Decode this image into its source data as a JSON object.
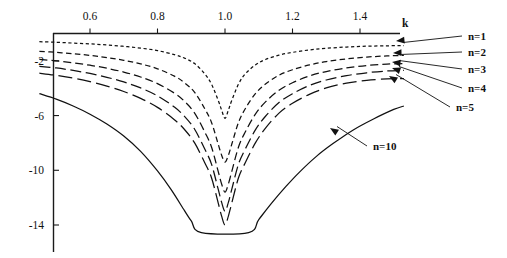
{
  "chart_data": {
    "type": "line",
    "title": "",
    "subtitle": "",
    "xlabel": "k",
    "ylabel": "",
    "xlim": [
      0.45,
      1.56
    ],
    "ylim": [
      -15.2,
      0.0
    ],
    "grid": false,
    "legend_position": "right-annotations",
    "x_ticks": [
      0.6,
      0.8,
      1.0,
      1.2,
      1.4
    ],
    "x_tick_labels": [
      "0.6",
      "0.8",
      "1.0",
      "1.2",
      "1.4"
    ],
    "y_ticks": [
      -2,
      -6,
      -10,
      -14
    ],
    "y_tick_labels": [
      "-2",
      "-6",
      "-10",
      "-14"
    ],
    "axis_note": "x-axis drawn at top of plot, y-axis at left; curves dip to sharp minima at k = 1.0",
    "series": [
      {
        "name": "n=1",
        "label": "n=1",
        "style": "dotted",
        "minimum_x": 1.0,
        "minimum_y": -6.2,
        "left_end_y": -0.6,
        "right_end_y": -0.9,
        "x": [
          0.45,
          0.5,
          0.55,
          0.6,
          0.65,
          0.7,
          0.75,
          0.8,
          0.85,
          0.88,
          0.91,
          0.94,
          0.96,
          0.98,
          0.99,
          1.0,
          1.01,
          1.02,
          1.04,
          1.06,
          1.09,
          1.12,
          1.16,
          1.2,
          1.25,
          1.3,
          1.36,
          1.42,
          1.48,
          1.53
        ],
        "y": [
          -0.6,
          -0.64,
          -0.7,
          -0.76,
          -0.84,
          -0.94,
          -1.07,
          -1.25,
          -1.55,
          -1.8,
          -2.2,
          -2.95,
          -3.7,
          -4.9,
          -5.6,
          -6.2,
          -5.6,
          -4.9,
          -3.7,
          -2.95,
          -2.3,
          -1.9,
          -1.58,
          -1.38,
          -1.2,
          -1.08,
          -0.99,
          -0.93,
          -0.9,
          -0.88
        ]
      },
      {
        "name": "n=2",
        "label": "n=2",
        "style": "dashed-short",
        "minimum_x": 1.0,
        "minimum_y": -9.4,
        "left_end_y": -1.3,
        "right_end_y": -1.6,
        "x": [
          0.45,
          0.5,
          0.55,
          0.6,
          0.65,
          0.7,
          0.75,
          0.8,
          0.85,
          0.88,
          0.91,
          0.94,
          0.96,
          0.98,
          0.99,
          1.0,
          1.01,
          1.02,
          1.04,
          1.06,
          1.09,
          1.12,
          1.16,
          1.2,
          1.25,
          1.3,
          1.36,
          1.42,
          1.48,
          1.53
        ],
        "y": [
          -1.3,
          -1.38,
          -1.48,
          -1.6,
          -1.76,
          -1.96,
          -2.22,
          -2.58,
          -3.12,
          -3.6,
          -4.3,
          -5.5,
          -6.5,
          -8.1,
          -8.9,
          -9.4,
          -8.9,
          -8.1,
          -6.5,
          -5.5,
          -4.4,
          -3.7,
          -3.05,
          -2.65,
          -2.3,
          -2.05,
          -1.86,
          -1.72,
          -1.64,
          -1.6
        ]
      },
      {
        "name": "n=3",
        "label": "n=3",
        "style": "dashed-medium",
        "minimum_x": 1.0,
        "minimum_y": -11.6,
        "left_end_y": -1.9,
        "right_end_y": -2.2,
        "x": [
          0.45,
          0.5,
          0.55,
          0.6,
          0.65,
          0.7,
          0.75,
          0.8,
          0.85,
          0.88,
          0.91,
          0.94,
          0.96,
          0.98,
          0.99,
          1.0,
          1.01,
          1.02,
          1.04,
          1.06,
          1.09,
          1.12,
          1.16,
          1.2,
          1.25,
          1.3,
          1.36,
          1.42,
          1.48,
          1.53
        ],
        "y": [
          -1.9,
          -2.0,
          -2.14,
          -2.32,
          -2.54,
          -2.82,
          -3.18,
          -3.66,
          -4.36,
          -4.96,
          -5.82,
          -7.2,
          -8.3,
          -10.1,
          -11.0,
          -11.6,
          -11.0,
          -10.1,
          -8.3,
          -7.2,
          -5.9,
          -5.0,
          -4.15,
          -3.6,
          -3.1,
          -2.78,
          -2.52,
          -2.34,
          -2.24,
          -2.2
        ]
      },
      {
        "name": "n=4",
        "label": "n=4",
        "style": "dashed-long",
        "minimum_x": 1.0,
        "minimum_y": -13.0,
        "left_end_y": -2.4,
        "right_end_y": -2.7,
        "x": [
          0.45,
          0.5,
          0.55,
          0.6,
          0.65,
          0.7,
          0.75,
          0.8,
          0.85,
          0.88,
          0.91,
          0.94,
          0.96,
          0.98,
          0.99,
          1.0,
          1.01,
          1.02,
          1.04,
          1.06,
          1.09,
          1.12,
          1.16,
          1.2,
          1.25,
          1.3,
          1.36,
          1.42,
          1.48,
          1.53
        ],
        "y": [
          -2.4,
          -2.52,
          -2.7,
          -2.92,
          -3.2,
          -3.54,
          -3.98,
          -4.56,
          -5.38,
          -6.06,
          -7.0,
          -8.45,
          -9.55,
          -11.4,
          -12.35,
          -13.0,
          -12.35,
          -11.4,
          -9.55,
          -8.45,
          -7.05,
          -6.05,
          -5.05,
          -4.4,
          -3.8,
          -3.4,
          -3.08,
          -2.87,
          -2.74,
          -2.7
        ]
      },
      {
        "name": "n=5",
        "label": "n=5",
        "style": "dashed-xlong",
        "minimum_x": 1.0,
        "minimum_y": -14.0,
        "left_end_y": -2.9,
        "right_end_y": -3.3,
        "x": [
          0.45,
          0.5,
          0.55,
          0.6,
          0.65,
          0.7,
          0.75,
          0.8,
          0.85,
          0.88,
          0.91,
          0.94,
          0.96,
          0.98,
          0.99,
          1.0,
          1.01,
          1.02,
          1.04,
          1.06,
          1.09,
          1.12,
          1.16,
          1.2,
          1.25,
          1.3,
          1.36,
          1.42,
          1.48,
          1.53
        ],
        "y": [
          -2.9,
          -3.06,
          -3.26,
          -3.52,
          -3.84,
          -4.24,
          -4.74,
          -5.4,
          -6.3,
          -7.02,
          -8.0,
          -9.45,
          -10.55,
          -12.4,
          -13.35,
          -14.0,
          -13.35,
          -12.4,
          -10.55,
          -9.45,
          -8.0,
          -6.92,
          -5.82,
          -5.1,
          -4.45,
          -3.98,
          -3.63,
          -3.42,
          -3.32,
          -3.3
        ]
      },
      {
        "name": "n=10",
        "label": "n=10",
        "style": "solid",
        "minimum_x": 1.0,
        "minimum_y": -14.55,
        "flat_bottom_from_x": 0.93,
        "flat_bottom_to_x": 1.07,
        "left_end_y": -4.4,
        "right_end_y": -5.3,
        "x": [
          0.45,
          0.5,
          0.55,
          0.6,
          0.65,
          0.7,
          0.75,
          0.8,
          0.84,
          0.88,
          0.9,
          0.93,
          1.07,
          1.1,
          1.14,
          1.18,
          1.22,
          1.27,
          1.32,
          1.38,
          1.44,
          1.5,
          1.53
        ],
        "y": [
          -4.4,
          -4.8,
          -5.3,
          -5.9,
          -6.62,
          -7.5,
          -8.62,
          -10.05,
          -11.4,
          -12.95,
          -13.7,
          -14.55,
          -14.55,
          -13.6,
          -12.35,
          -11.2,
          -10.15,
          -9.0,
          -8.05,
          -7.05,
          -6.25,
          -5.55,
          -5.3
        ]
      }
    ],
    "annotations": [
      {
        "label": "n=1",
        "text_x": 468,
        "text_y": 40,
        "arrow_tip_x": 396,
        "arrow_tip_y": 41
      },
      {
        "label": "n=2",
        "text_x": 468,
        "text_y": 56,
        "arrow_tip_x": 393,
        "arrow_tip_y": 53
      },
      {
        "label": "n=3",
        "text_x": 468,
        "text_y": 73,
        "arrow_tip_x": 392,
        "arrow_tip_y": 62
      },
      {
        "label": "n=4",
        "text_x": 468,
        "text_y": 92,
        "arrow_tip_x": 392,
        "arrow_tip_y": 68
      },
      {
        "label": "n=5",
        "text_x": 456,
        "text_y": 111,
        "arrow_tip_x": 389,
        "arrow_tip_y": 76
      },
      {
        "label": "n=10",
        "text_x": 373,
        "text_y": 150,
        "arrow_tip_x": 330,
        "arrow_tip_y": 128
      }
    ]
  },
  "axis": {
    "x_title": "k",
    "x_title_x": 402,
    "x_title_y": 27
  }
}
